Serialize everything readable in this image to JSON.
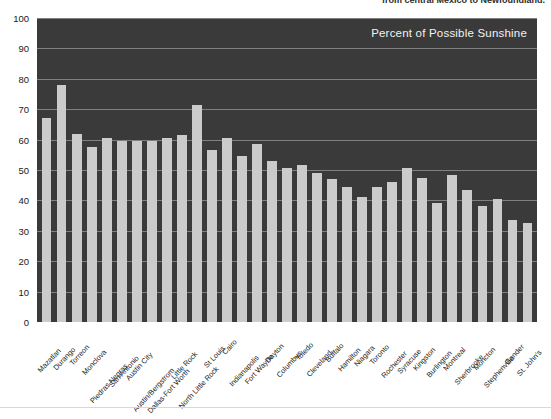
{
  "top_caption": {
    "text": "from central Mexico to Newfoundland."
  },
  "chart_data": {
    "type": "bar",
    "title": "Percent of Possible Sunshine",
    "xlabel": "",
    "ylabel": "",
    "ylim": [
      0,
      100
    ],
    "ytick_step": 10,
    "grid": true,
    "legend": "none",
    "bar_color": "#cbcbcb",
    "plot_background": "#3a3a3a",
    "gridline_color": "#8d8d8d",
    "title_color": "#f2f2f2",
    "yticks": [
      0,
      10,
      20,
      30,
      40,
      50,
      60,
      70,
      80,
      90,
      100
    ],
    "categories": [
      "Mazatlan",
      "Durango",
      "Torreon",
      "Monclova",
      "Piedras Negras",
      "San Antonio",
      "Austin City",
      "Austin/Bergstrom",
      "Dallas-Fort Worth",
      "Little Rock",
      "North Little Rock",
      "St Louis",
      "Cairo",
      "Indianapolis",
      "Fort Wayne",
      "Dayton",
      "Columbus",
      "Toledo",
      "Cleveland",
      "Buffalo",
      "Hamilton",
      "Niagara",
      "Toronto",
      "Rochester",
      "Syracuse",
      "Kingston",
      "Burlington",
      "Montreal",
      "Sherbrooke",
      "Moncton",
      "Stephenville",
      "Gander",
      "St. John's"
    ],
    "values": [
      67,
      78,
      62,
      57.5,
      60.5,
      59.5,
      59.5,
      59.5,
      60.5,
      61.5,
      71.5,
      56.5,
      60.5,
      54.5,
      58.5,
      53,
      50.5,
      51.5,
      49,
      47,
      44.5,
      41,
      44.5,
      46,
      50.5,
      47.5,
      39,
      48.5,
      43.5,
      38,
      40.5,
      33.5,
      32.5
    ]
  }
}
